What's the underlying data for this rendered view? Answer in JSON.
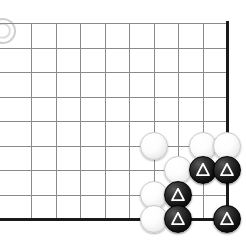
{
  "figure": {
    "title": "Go board corner diagram",
    "caption": "",
    "board_style": "right-bottom corner section",
    "background_color": "#ffffff",
    "grid_line_color": "#8a8a8a",
    "edge_line_color": "#1a1a1a",
    "black_stone_color": "#141414",
    "white_stone_color": "#fdfdfd",
    "marker_color": "#ffffff"
  },
  "board": {
    "visible_columns": 9,
    "visible_rows": 9,
    "cell_size_px": 24.5,
    "origin_x_px": 31,
    "origin_y_px": 23,
    "stone_diameter_px": 28,
    "edges": [
      {
        "name": "right-edge",
        "orientation": "vertical"
      },
      {
        "name": "bottom-edge",
        "orientation": "horizontal"
      }
    ]
  },
  "stones": [
    {
      "id": "w1",
      "color": "white",
      "col": 5,
      "row": 5,
      "marker": "none"
    },
    {
      "id": "w2",
      "color": "white",
      "col": 7,
      "row": 5,
      "marker": "none"
    },
    {
      "id": "w3",
      "color": "white",
      "col": 8,
      "row": 5,
      "marker": "none"
    },
    {
      "id": "w4",
      "color": "white",
      "col": 6,
      "row": 6,
      "marker": "none"
    },
    {
      "id": "w5",
      "color": "white",
      "col": 5,
      "row": 7,
      "marker": "none"
    },
    {
      "id": "w6",
      "color": "white",
      "col": 5,
      "row": 8,
      "marker": "none"
    },
    {
      "id": "b1",
      "color": "black",
      "col": 7,
      "row": 6,
      "marker": "triangle"
    },
    {
      "id": "b2",
      "color": "black",
      "col": 8,
      "row": 6,
      "marker": "triangle"
    },
    {
      "id": "b3",
      "color": "black",
      "col": 6,
      "row": 7,
      "marker": "triangle"
    },
    {
      "id": "b4",
      "color": "black",
      "col": 6,
      "row": 8,
      "marker": "triangle"
    },
    {
      "id": "b5",
      "color": "black",
      "col": 8,
      "row": 8,
      "marker": "triangle"
    }
  ],
  "corner_logo": {
    "label": "page-mark",
    "visible": true
  }
}
